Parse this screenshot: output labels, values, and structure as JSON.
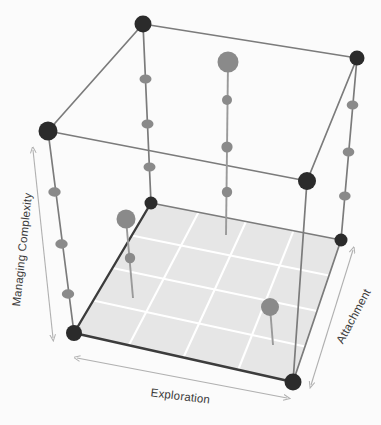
{
  "figure": {
    "background_color": "#fbfbfb"
  },
  "colors": {
    "vertex_dark": "#2b2b2b",
    "marker_gray": "#8a8a8a",
    "edge_far": "#7b7b7b",
    "edge_near": "#3c3c3c",
    "floor_fill": "#e6e6e6",
    "floor_grid": "#ffffff",
    "arrow_color": "#b0b0b0",
    "label_text": "#3a3a3a"
  },
  "axes": [
    {
      "id": "managing-complexity",
      "label": "Managing Complexity",
      "orientation": "vertical-left",
      "rotation_deg": -86
    },
    {
      "id": "exploration",
      "label": "Exploration",
      "orientation": "bottom-horizontal",
      "rotation_deg": 7
    },
    {
      "id": "attachment",
      "label": "Attachment",
      "orientation": "right-diagonal",
      "rotation_deg": -60
    }
  ],
  "cube": {
    "vertices": [
      {
        "id": "back-top-left",
        "x": 143,
        "y": 24,
        "kind": "dark",
        "r": 8.5
      },
      {
        "id": "back-top-right",
        "x": 357,
        "y": 58,
        "kind": "dark",
        "r": 7.5
      },
      {
        "id": "front-top-left",
        "x": 48,
        "y": 131,
        "kind": "dark",
        "r": 9.5
      },
      {
        "id": "front-top-right",
        "x": 307,
        "y": 181,
        "kind": "dark",
        "r": 9.0
      },
      {
        "id": "back-bot-left",
        "x": 151,
        "y": 203,
        "kind": "dark",
        "r": 6.5
      },
      {
        "id": "back-bot-right",
        "x": 341,
        "y": 240,
        "kind": "dark",
        "r": 6.5
      },
      {
        "id": "front-bot-left",
        "x": 74,
        "y": 333,
        "kind": "dark",
        "r": 8.0
      },
      {
        "id": "front-bot-right",
        "x": 293,
        "y": 382,
        "kind": "dark",
        "r": 8.5
      }
    ],
    "edge_markers": {
      "description": "Small gray dots spaced along the vertical cube edges",
      "radius": 5.2
    }
  },
  "floor": {
    "grid_divisions": 4,
    "shaded": true
  },
  "pins": [
    {
      "id": "pin-center-tall",
      "head_x": 228,
      "head_y": 62,
      "head_r": 10.5,
      "tip_x": 226,
      "tip_y": 235,
      "beads": [
        {
          "x": 227,
          "y": 100,
          "r": 5.0
        },
        {
          "x": 227,
          "y": 147,
          "r": 5.6
        },
        {
          "x": 226,
          "y": 192,
          "r": 5.2
        }
      ]
    },
    {
      "id": "pin-left-mid",
      "head_x": 126,
      "head_y": 219,
      "head_r": 9.5,
      "tip_x": 133,
      "tip_y": 298,
      "beads": [
        {
          "x": 130,
          "y": 258,
          "r": 5.2
        }
      ]
    },
    {
      "id": "pin-right-low",
      "head_x": 270,
      "head_y": 307,
      "head_r": 9.0,
      "tip_x": 273,
      "tip_y": 345,
      "beads": []
    }
  ]
}
